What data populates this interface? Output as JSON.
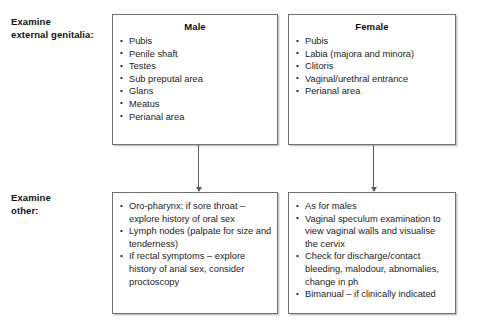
{
  "figure": {
    "row_labels": [
      {
        "id": "genitalia",
        "text": "Examine\nexternal genitalia:"
      },
      {
        "id": "other",
        "text": "Examine\nother:"
      }
    ],
    "boxes": {
      "male": {
        "title": "Male",
        "items": [
          "Pubis",
          "Penile shaft",
          "Testes",
          "Sub preputal area",
          "Glans",
          "Meatus",
          "Perianal area"
        ]
      },
      "female": {
        "title": "Female",
        "items": [
          "Pubis",
          "Labia (majora and minora)",
          "Clitoris",
          "Vaginal/urethral entrance",
          "Perianal area"
        ]
      },
      "other_male": {
        "title": "",
        "items": [
          "Oro-pharynx: if sore throat – explore history of oral sex",
          "Lymph nodes (palpate for size and tenderness)",
          "If rectal symptoms – explore history of anal sex, consider proctoscopy"
        ]
      },
      "other_female": {
        "title": "",
        "items": [
          "As for males",
          "Vaginal speculum examination to view vaginal walls and visualise the cervix",
          "Check for discharge/contact bleeding, malodour, abnomalies, change in ph",
          "Bimanual – if clinically indicated"
        ]
      }
    },
    "colors": {
      "border": "#6f6f6f",
      "shadow": "#c9c9c9",
      "arrow": "#5c5c5c",
      "text": "#1c1c1c",
      "background": "#ffffff"
    }
  }
}
